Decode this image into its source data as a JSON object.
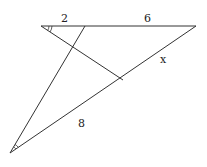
{
  "diagram": {
    "type": "geometry-triangle",
    "labels": {
      "top_left_segment": "2",
      "top_right_segment": "6",
      "hypotenuse_upper": "x",
      "hypotenuse_lower": "8"
    },
    "angle_markers": {
      "top_left": "double-arc",
      "bottom_left": "double-arc"
    },
    "line_color": "#333333"
  }
}
